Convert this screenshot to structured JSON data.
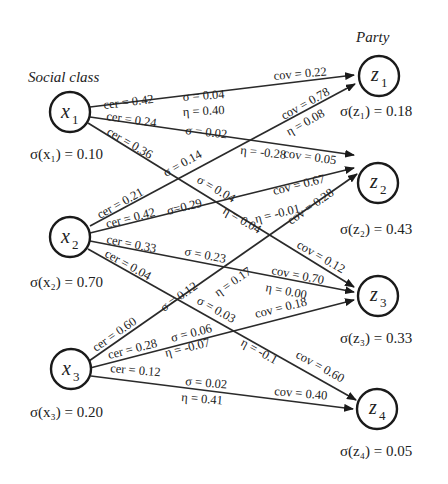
{
  "groups": {
    "left_title": "Social class",
    "right_title": "Party"
  },
  "nodes": {
    "x1": {
      "name": "x",
      "sub": "1",
      "sigma": "σ(x₁) = 0.10"
    },
    "x2": {
      "name": "x",
      "sub": "2",
      "sigma": "σ(x₂) = 0.70"
    },
    "x3": {
      "name": "x",
      "sub": "3",
      "sigma": "σ(x₃) = 0.20"
    },
    "z1": {
      "name": "z",
      "sub": "1",
      "sigma": "σ(z₁) = 0.18"
    },
    "z2": {
      "name": "z",
      "sub": "2",
      "sigma": "σ(z₂) = 0.43"
    },
    "z3": {
      "name": "z",
      "sub": "3",
      "sigma": "σ(z₃) = 0.33"
    },
    "z4": {
      "name": "z",
      "sub": "4",
      "sigma": "σ(z₄) = 0.05"
    }
  },
  "edges": {
    "x1_z1": {
      "cer": "cer = 0.42",
      "sigma": "σ = 0.04",
      "eta": "η = 0.40",
      "cov": "cov = 0.22"
    },
    "x1_z2": {
      "cer": "cer = 0.24",
      "sigma": "σ = 0.02",
      "eta": "η = -0.28",
      "cov": "cov = 0.05"
    },
    "x1_z3": {
      "cer": "cer = 0.36",
      "sigma": "σ = 0.04",
      "eta": "η = 0.04",
      "cov": "cov = 0.12"
    },
    "x2_z1": {
      "cer": "cer = 0.21",
      "sigma": "σ = 0.14",
      "eta": "η = 0.08",
      "cov": "cov = 0.78"
    },
    "x2_z2": {
      "cer": "cer = 0.42",
      "sigma": "σ=0.29",
      "eta": "η = -0.01",
      "cov": "cov = 0.67"
    },
    "x2_z3": {
      "cer": "cer = 0.33",
      "sigma": "σ = 0.23",
      "eta": "η = 0.00",
      "cov": "cov = 0.70"
    },
    "x2_z4": {
      "cer": "cer = 0.04",
      "sigma": "σ = 0.03",
      "eta": "η = -0.1",
      "cov": "cov = 0.60"
    },
    "x3_z2": {
      "cer": "cer = 0.60",
      "sigma": "σ = 0.12",
      "eta": "η = 0.17",
      "cov": "cov = 0.28"
    },
    "x3_z3": {
      "cer": "cer = 0.28",
      "sigma": "σ = 0.06",
      "eta": "η = -0.07",
      "cov": "cov = 0.18"
    },
    "x3_z4": {
      "cer": "cer = 0.12",
      "sigma": "σ = 0.02",
      "eta": "η = 0.41",
      "cov": "cov = 0.40"
    }
  }
}
